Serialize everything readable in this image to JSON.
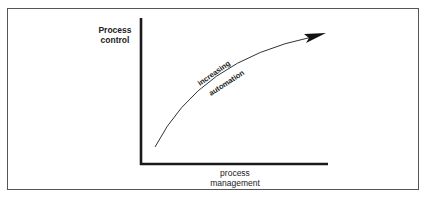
{
  "diagram": {
    "y_axis_label_line1": "Process",
    "y_axis_label_line2": "control",
    "x_axis_label_line1": "process",
    "x_axis_label_line2": "management",
    "curve_label_line1": "increasing",
    "curve_label_line2": "automation"
  }
}
